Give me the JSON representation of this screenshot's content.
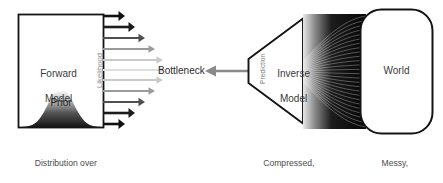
{
  "diagram": {
    "forward_model": {
      "label_line1": "Forward",
      "label_line2": "Model",
      "prior_label": "Prior",
      "likelihood_label": "Likelihood",
      "caption_line1": "Distribution over",
      "caption_bold": "relevant",
      "caption_rest": " parameters"
    },
    "bottleneck": {
      "label": "Bottleneck",
      "arrow_color": "#8a8a8a"
    },
    "inverse_model": {
      "label_line1": "Inverse",
      "label_line2": "Model",
      "prediction_label": "Prediction",
      "caption_line1": "Compressed,",
      "caption_line2": "no uncertainty"
    },
    "world": {
      "label": "World",
      "caption_line1": "Messy,",
      "caption_line2": "high-dimensional"
    },
    "colors": {
      "stroke": "#1a1a1a",
      "fill": "#ffffff",
      "text": "#2b2b2b",
      "muted_text": "#4b4b4b",
      "vertical_text": "#8e8e8e",
      "background": "#ffffff"
    },
    "likelihood_arrows": [
      {
        "index": 0,
        "y": 16,
        "length": 22,
        "color": "#111111",
        "width": 2.6
      },
      {
        "index": 1,
        "y": 27,
        "length": 32,
        "color": "#1c1c1c",
        "width": 2.6
      },
      {
        "index": 2,
        "y": 38,
        "length": 42,
        "color": "#4f4f4f",
        "width": 2.2
      },
      {
        "index": 3,
        "y": 49,
        "length": 52,
        "color": "#9a9a9a",
        "width": 2.0
      },
      {
        "index": 4,
        "y": 60,
        "length": 60,
        "color": "#c9c9c9",
        "width": 2.0
      },
      {
        "index": 5,
        "y": 70,
        "length": 62,
        "color": "#dedede",
        "width": 2.0
      },
      {
        "index": 6,
        "y": 80,
        "length": 60,
        "color": "#c9c9c9",
        "width": 2.0
      },
      {
        "index": 7,
        "y": 91,
        "length": 52,
        "color": "#9a9a9a",
        "width": 2.0
      },
      {
        "index": 8,
        "y": 102,
        "length": 42,
        "color": "#4f4f4f",
        "width": 2.2
      },
      {
        "index": 9,
        "y": 113,
        "length": 32,
        "color": "#1c1c1c",
        "width": 2.6
      },
      {
        "index": 10,
        "y": 124,
        "length": 22,
        "color": "#111111",
        "width": 2.6
      }
    ]
  }
}
